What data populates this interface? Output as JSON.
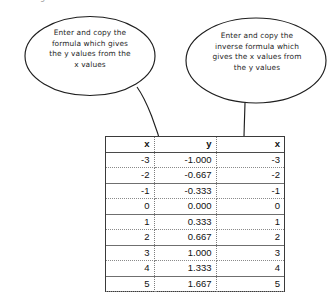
{
  "document": {
    "top_artifact_glyph": "g"
  },
  "callouts": [
    {
      "id": "left",
      "text": "Enter and copy the\nformula which gives\nthe y values from the\nx values",
      "shape": "ellipse",
      "pointer": "curved-arrow-down-right"
    },
    {
      "id": "right",
      "text": "Enter and copy the\ninverse formula which\ngives the x values from\nthe y values",
      "shape": "ellipse",
      "pointer": "straight-arrow-down"
    }
  ],
  "table": {
    "headers": [
      "x",
      "y",
      "x"
    ],
    "rows": [
      [
        "-3",
        "-1.000",
        "-3"
      ],
      [
        "-2",
        "-0.667",
        "-2"
      ],
      [
        "-1",
        "-0.333",
        "-1"
      ],
      [
        "0",
        "0.000",
        "0"
      ],
      [
        "1",
        "0.333",
        "1"
      ],
      [
        "2",
        "0.667",
        "2"
      ],
      [
        "3",
        "1.000",
        "3"
      ],
      [
        "4",
        "1.333",
        "4"
      ],
      [
        "5",
        "1.667",
        "5"
      ]
    ]
  },
  "colors": {
    "ink": "#1a1a1a",
    "grid_solid": "#6f6f6f",
    "grid_dotted": "#8a8a8a",
    "table_border": "#3a3a3a",
    "background": "#ffffff"
  },
  "chart_data": {
    "type": "table",
    "title": "",
    "columns": [
      "x",
      "y",
      "x"
    ],
    "series": [
      {
        "name": "x",
        "values": [
          -3,
          -2,
          -1,
          0,
          1,
          2,
          3,
          4,
          5
        ]
      },
      {
        "name": "y",
        "values": [
          -1.0,
          -0.667,
          -0.333,
          0.0,
          0.333,
          0.667,
          1.0,
          1.333,
          1.667
        ]
      },
      {
        "name": "x (inverse)",
        "values": [
          -3,
          -2,
          -1,
          0,
          1,
          2,
          3,
          4,
          5
        ]
      }
    ],
    "xlabel": "x",
    "ylabel": "y",
    "annotations": [
      "Enter and copy the formula which gives the y values from the x values",
      "Enter and copy the inverse formula which gives the x values from the y values"
    ]
  }
}
